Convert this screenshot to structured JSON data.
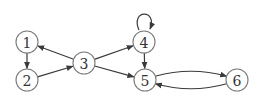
{
  "diagram": {
    "type": "directed-graph",
    "style": {
      "edge_color": "#3a3a3a",
      "node_stroke": "#7a7a7a",
      "label_color": "#333333",
      "background": "#ffffff"
    },
    "nodes": [
      {
        "id": "1",
        "label": "1",
        "x": 27,
        "y": 42,
        "r": 11
      },
      {
        "id": "2",
        "label": "2",
        "x": 27,
        "y": 80,
        "r": 11
      },
      {
        "id": "3",
        "label": "3",
        "x": 84,
        "y": 63,
        "r": 11
      },
      {
        "id": "4",
        "label": "4",
        "x": 144,
        "y": 42,
        "r": 11
      },
      {
        "id": "5",
        "label": "5",
        "x": 145,
        "y": 80,
        "r": 11
      },
      {
        "id": "6",
        "label": "6",
        "x": 237,
        "y": 80,
        "r": 11
      }
    ],
    "edges": [
      {
        "from": "1",
        "to": "2",
        "shape": "straight"
      },
      {
        "from": "2",
        "to": "3",
        "shape": "straight"
      },
      {
        "from": "3",
        "to": "1",
        "shape": "straight"
      },
      {
        "from": "3",
        "to": "4",
        "shape": "straight"
      },
      {
        "from": "3",
        "to": "5",
        "shape": "straight"
      },
      {
        "from": "4",
        "to": "4",
        "shape": "self-loop"
      },
      {
        "from": "4",
        "to": "5",
        "shape": "straight"
      },
      {
        "from": "5",
        "to": "6",
        "shape": "curved-above"
      },
      {
        "from": "6",
        "to": "5",
        "shape": "curved-below"
      }
    ]
  }
}
